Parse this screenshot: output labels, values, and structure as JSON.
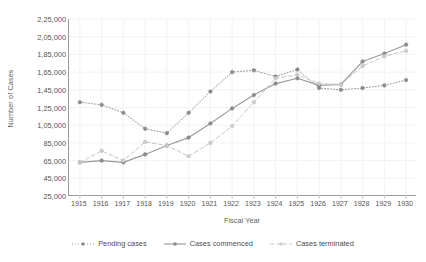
{
  "chart_data": {
    "type": "line",
    "title": "",
    "xlabel": "Fiscal Year",
    "ylabel": "Number of Cases",
    "categories": [
      "1915",
      "1916",
      "1917",
      "1918",
      "1919",
      "1920",
      "1921",
      "1922",
      "1923",
      "1924",
      "1925",
      "1926",
      "1927",
      "1928",
      "1929",
      "1930"
    ],
    "x": [
      1915,
      1916,
      1917,
      1918,
      1919,
      1920,
      1921,
      1922,
      1923,
      1924,
      1925,
      1926,
      1927,
      1928,
      1929,
      1930
    ],
    "ylim": [
      25000,
      225000
    ],
    "ytick_values": [
      25000,
      45000,
      65000,
      85000,
      105000,
      125000,
      145000,
      165000,
      185000,
      205000,
      225000
    ],
    "ytick_labels": [
      "25,000",
      "45,000",
      "65,000",
      "85,000",
      "1,05,000",
      "1,25,000",
      "1,45,000",
      "1,65,000",
      "1,85,000",
      "2,05,000",
      "2,25,000"
    ],
    "grid": true,
    "legend_position": "bottom",
    "series": [
      {
        "name": "Pending cases",
        "style": "dotted",
        "color": "#8f8f8f",
        "values": [
          131000,
          128000,
          119000,
          101000,
          96000,
          119000,
          143000,
          165000,
          167000,
          160000,
          168000,
          147000,
          145000,
          147000,
          150000,
          156000
        ]
      },
      {
        "name": "Cases commenced",
        "style": "solid",
        "color": "#9a9a9a",
        "values": [
          63000,
          65000,
          63000,
          72000,
          82000,
          91000,
          107000,
          124000,
          139000,
          152000,
          158000,
          150000,
          151000,
          177000,
          186000,
          196000
        ]
      },
      {
        "name": "Cases terminated",
        "style": "dashed",
        "color": "#c2c2c2",
        "values": [
          63000,
          76000,
          65000,
          86000,
          82000,
          70000,
          85000,
          104000,
          131000,
          158000,
          162000,
          152000,
          151000,
          172000,
          183000,
          189000
        ]
      }
    ]
  }
}
